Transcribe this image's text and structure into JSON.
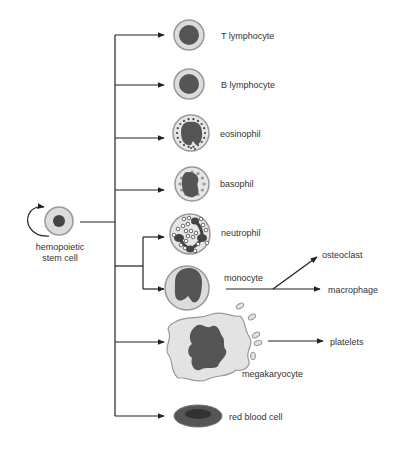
{
  "diagram": {
    "stem_cell": {
      "label_line1": "hemopoietic",
      "label_line2": "stem cell"
    },
    "cells": {
      "t_lymphocyte": "T lymphocyte",
      "b_lymphocyte": "B lymphocyte",
      "eosinophil": "eosinophil",
      "basophil": "basophil",
      "neutrophil": "neutrophil",
      "monocyte": "monocyte",
      "megakaryocyte": "megakaryocyte",
      "red_blood_cell": "red blood cell"
    },
    "derived": {
      "osteoclast": "osteoclast",
      "macrophage": "macrophage",
      "platelets": "platelets"
    }
  },
  "colors": {
    "line": "#222222",
    "cytoplasm": "#dcdcdc",
    "membrane": "#999999",
    "nucleus": "#555555",
    "text": "#333333"
  }
}
